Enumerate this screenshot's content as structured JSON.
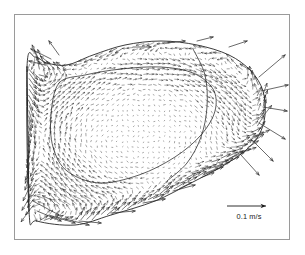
{
  "figure": {
    "type": "vector-field",
    "caption_text": "",
    "background_color": "#ffffff",
    "frame_color": "#9a9a9a",
    "ink_color": "#1a1a1a"
  },
  "scalebar": {
    "label": "0.1 m/s",
    "value": 0.1,
    "units": "m/s",
    "arrow_length_px": 36,
    "arrow_direction": "right"
  },
  "chart_data": {
    "type": "quiver",
    "title": "",
    "xlabel": "",
    "ylabel": "",
    "units": "m/s",
    "reference_vector": {
      "label": "0.1 m/s",
      "magnitude": 0.1
    },
    "domain_outline": [
      [
        12,
        52
      ],
      [
        14,
        196
      ],
      [
        22,
        206
      ],
      [
        60,
        210
      ],
      [
        96,
        200
      ],
      [
        140,
        186
      ],
      [
        176,
        168
      ],
      [
        206,
        152
      ],
      [
        230,
        136
      ],
      [
        244,
        120
      ],
      [
        250,
        100
      ],
      [
        248,
        76
      ],
      [
        236,
        56
      ],
      [
        214,
        40
      ],
      [
        182,
        30
      ],
      [
        146,
        26
      ],
      [
        110,
        30
      ],
      [
        78,
        40
      ],
      [
        52,
        50
      ],
      [
        32,
        48
      ],
      [
        20,
        42
      ]
    ],
    "inner_contour": [
      [
        44,
        68
      ],
      [
        36,
        100
      ],
      [
        38,
        132
      ],
      [
        52,
        156
      ],
      [
        84,
        168
      ],
      [
        124,
        160
      ],
      [
        160,
        142
      ],
      [
        186,
        120
      ],
      [
        200,
        96
      ],
      [
        198,
        74
      ],
      [
        178,
        58
      ],
      [
        146,
        52
      ],
      [
        106,
        54
      ],
      [
        70,
        60
      ]
    ],
    "second_contour": [
      [
        178,
        34
      ],
      [
        190,
        60
      ],
      [
        192,
        92
      ],
      [
        186,
        122
      ],
      [
        172,
        148
      ],
      [
        152,
        166
      ]
    ],
    "grid": {
      "nx": 46,
      "ny": 38,
      "spacing_px": 5.2
    },
    "interior_magnitude_range": [
      0.002,
      0.03
    ],
    "boundary_magnitude_range": [
      0.03,
      0.13
    ],
    "legend_position": "bottom-right",
    "axes_visible": false,
    "grid_visible": false
  }
}
